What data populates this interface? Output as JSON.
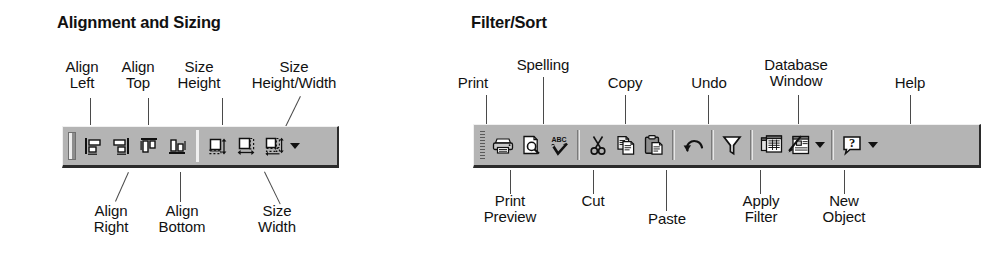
{
  "figure": {
    "type": "toolbar-reference-diagram",
    "background_color": "#ffffff",
    "toolbar_face_color": "#b4b4b4",
    "toolbar_shadow_color": "#2b2b2b",
    "text_color": "#111111"
  },
  "panels": [
    {
      "id": "alignment-and-sizing",
      "title": "Alignment and Sizing",
      "toolbar": {
        "name": "Alignment and Sizing toolbar",
        "has_grip": true,
        "has_overflow_arrow": true,
        "buttons": [
          {
            "icon": "align-left-icon",
            "label": "Align Left"
          },
          {
            "icon": "align-right-icon",
            "label": "Align Right"
          },
          {
            "icon": "align-top-icon",
            "label": "Align Top"
          },
          {
            "icon": "align-bottom-icon",
            "label": "Align Bottom"
          },
          {
            "icon": "size-height-icon",
            "label": "Size Height"
          },
          {
            "icon": "size-width-icon",
            "label": "Size Width"
          },
          {
            "icon": "size-height-width-icon",
            "label": "Size Height/Width"
          }
        ]
      },
      "callouts_above": [
        {
          "lines": [
            "Align",
            "Left"
          ]
        },
        {
          "lines": [
            "Align",
            "Top"
          ]
        },
        {
          "lines": [
            "Size",
            "Height"
          ]
        },
        {
          "lines": [
            "Size",
            "Height/Width"
          ]
        }
      ],
      "callouts_below": [
        {
          "lines": [
            "Align",
            "Right"
          ]
        },
        {
          "lines": [
            "Align",
            "Bottom"
          ]
        },
        {
          "lines": [
            "Size",
            "Width"
          ]
        }
      ]
    },
    {
      "id": "filter-sort",
      "title": "Filter/Sort",
      "toolbar": {
        "name": "Filter/Sort toolbar",
        "has_grip": true,
        "has_overflow_arrow": true,
        "buttons": [
          {
            "icon": "print-icon",
            "label": "Print"
          },
          {
            "icon": "print-preview-icon",
            "label": "Print Preview"
          },
          {
            "icon": "spelling-icon",
            "label": "Spelling"
          },
          {
            "icon": "cut-icon",
            "label": "Cut"
          },
          {
            "icon": "copy-icon",
            "label": "Copy"
          },
          {
            "icon": "paste-icon",
            "label": "Paste"
          },
          {
            "icon": "undo-icon",
            "label": "Undo"
          },
          {
            "icon": "apply-filter-icon",
            "label": "Apply Filter"
          },
          {
            "icon": "database-window-icon",
            "label": "Database Window"
          },
          {
            "icon": "new-object-icon",
            "label": "New Object"
          },
          {
            "icon": "help-icon",
            "label": "Help"
          }
        ]
      },
      "callouts_above": [
        {
          "lines": [
            "Print"
          ]
        },
        {
          "lines": [
            "Spelling"
          ]
        },
        {
          "lines": [
            "Copy"
          ]
        },
        {
          "lines": [
            "Undo"
          ]
        },
        {
          "lines": [
            "Database",
            "Window"
          ]
        },
        {
          "lines": [
            "Help"
          ]
        }
      ],
      "callouts_below": [
        {
          "lines": [
            "Print",
            "Preview"
          ]
        },
        {
          "lines": [
            "Cut"
          ]
        },
        {
          "lines": [
            "Paste"
          ]
        },
        {
          "lines": [
            "Apply",
            "Filter"
          ]
        },
        {
          "lines": [
            "New",
            "Object"
          ]
        }
      ]
    }
  ]
}
